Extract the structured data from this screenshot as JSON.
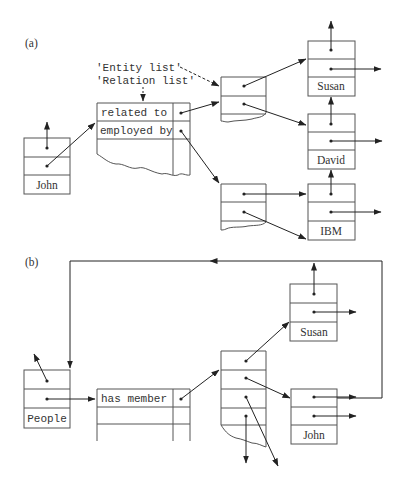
{
  "panel_a": {
    "label": "(a)",
    "annotation_entity": "'Entity list'",
    "annotation_relation": "'Relation list'",
    "relation_table": {
      "rows": [
        "related to",
        "employed by"
      ]
    },
    "entities": {
      "john": "John",
      "susan": "Susan",
      "david": "David",
      "ibm": "IBM"
    }
  },
  "panel_b": {
    "label": "(b)",
    "relation_table": {
      "rows": [
        "has member"
      ]
    },
    "entities": {
      "people": "People",
      "susan": "Susan",
      "john": "John"
    }
  }
}
